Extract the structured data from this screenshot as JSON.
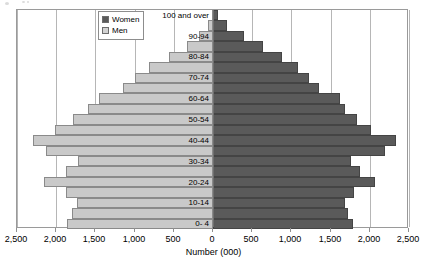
{
  "chart_data": {
    "type": "bar",
    "subtype": "population-pyramid",
    "title": "",
    "xlabel": "Number (000)",
    "ylabel": "",
    "xlim": [
      -2500,
      2500
    ],
    "grid": true,
    "legend_position": "top-left-inside",
    "xticks": [
      {
        "label": "2,500",
        "value": -2500
      },
      {
        "label": "2,000",
        "value": -2000
      },
      {
        "label": "1,500",
        "value": -1500
      },
      {
        "label": "1,000",
        "value": -1000
      },
      {
        "label": "500",
        "value": -500
      },
      {
        "label": "0",
        "value": 0
      },
      {
        "label": "500",
        "value": 500
      },
      {
        "label": "1,000",
        "value": 1000
      },
      {
        "label": "1,500",
        "value": 1500
      },
      {
        "label": "2,000",
        "value": 2000
      },
      {
        "label": "2,500",
        "value": 2500
      }
    ],
    "categories": [
      "100 and over",
      "95-99",
      "90-94",
      "85-89",
      "80-84",
      "85-89",
      "70-74",
      "65-69",
      "60-64",
      "55-59",
      "50-54",
      "45-49",
      "40-44",
      "35-39",
      "30-34",
      "25-29",
      "20-24",
      "15-19",
      "10-14",
      "5- 9",
      "0- 4"
    ],
    "axis_band_labels": [
      {
        "index": 0,
        "label": "100 and over"
      },
      {
        "index": 2,
        "label": "90-94"
      },
      {
        "index": 4,
        "label": "80-84"
      },
      {
        "index": 6,
        "label": "70-74"
      },
      {
        "index": 8,
        "label": "60-64"
      },
      {
        "index": 10,
        "label": "50-54"
      },
      {
        "index": 12,
        "label": "40-44"
      },
      {
        "index": 14,
        "label": "30-34"
      },
      {
        "index": 16,
        "label": "20-24"
      },
      {
        "index": 18,
        "label": "10-14"
      },
      {
        "index": 20,
        "label": "0- 4"
      }
    ],
    "series": [
      {
        "name": "Men",
        "color": "#c9c9c9",
        "side": "left",
        "values": [
          10,
          60,
          180,
          330,
          560,
          820,
          1000,
          1150,
          1460,
          1600,
          1780,
          2010,
          2290,
          2130,
          1720,
          1880,
          2160,
          1870,
          1740,
          1800,
          1860
        ]
      },
      {
        "name": "Women",
        "color": "#5a5a5a",
        "side": "right",
        "values": [
          60,
          180,
          400,
          640,
          880,
          1090,
          1230,
          1350,
          1620,
          1690,
          1840,
          2020,
          2330,
          2200,
          1760,
          1880,
          2060,
          1800,
          1680,
          1720,
          1780
        ]
      }
    ]
  },
  "legend": {
    "items": [
      {
        "label": "Women",
        "swatch": "women"
      },
      {
        "label": "Men",
        "swatch": "men"
      }
    ]
  },
  "colors": {
    "men": "#c9c9c9",
    "women": "#5a5a5a",
    "grid": "#b6b6b6",
    "axis": "#6f6f6f",
    "plot_border": "#9a9a9a"
  }
}
